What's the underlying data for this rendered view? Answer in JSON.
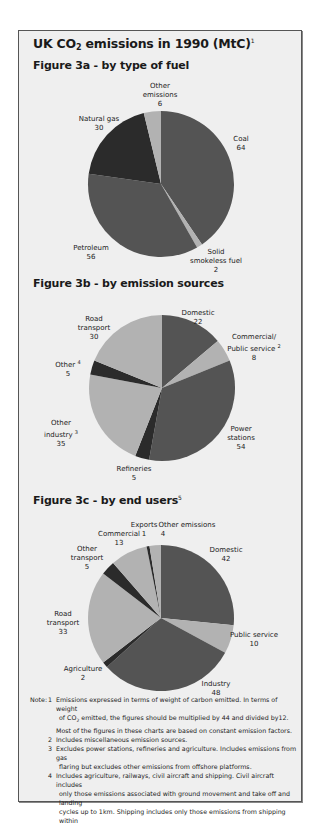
{
  "page": {
    "title_main": "UK CO",
    "title_sub": "2",
    "title_rest": " emissions in 1990 (MtC)",
    "title_sup": "1"
  },
  "colors": {
    "background": "#efefef",
    "dark": "#545454",
    "darkest": "#2b2b2b",
    "light": "#b2b2b2",
    "border": "#555555"
  },
  "chart_data": [
    {
      "type": "pie",
      "title": "Figure 3a - by type of fuel",
      "units": "MtC",
      "start_angle": "12 o'clock, clockwise",
      "categories": [
        "Coal",
        "Solid smokeless fuel",
        "Petroleum",
        "Natural gas",
        "Other emissions"
      ],
      "values": [
        64,
        2,
        56,
        30,
        6
      ],
      "shades": [
        "dark",
        "light",
        "dark",
        "darkest",
        "light"
      ]
    },
    {
      "type": "pie",
      "title": "Figure 3b - by emission sources",
      "units": "MtC",
      "start_angle": "12 o'clock, clockwise",
      "categories": [
        "Domestic",
        "Commercial/ Public service",
        "Power stations",
        "Refineries",
        "Other industry",
        "Other",
        "Road transport"
      ],
      "values": [
        22,
        8,
        54,
        5,
        35,
        5,
        30
      ],
      "shades": [
        "dark",
        "light",
        "dark",
        "darkest",
        "light",
        "darkest",
        "light"
      ],
      "footnote_refs": {
        "Commercial/ Public service": "2",
        "Other industry": "3",
        "Other": "4"
      }
    },
    {
      "type": "pie",
      "title": "Figure 3c - by end users",
      "title_sup": "5",
      "units": "MtC",
      "start_angle": "12 o'clock, clockwise",
      "categories": [
        "Domestic",
        "Public service",
        "Industry",
        "Agriculture",
        "Road transport",
        "Other transport",
        "Commercial",
        "Exports",
        "Other emissions"
      ],
      "values": [
        42,
        10,
        48,
        2,
        33,
        5,
        13,
        1,
        4
      ],
      "shades": [
        "dark",
        "light",
        "dark",
        "darkest",
        "light",
        "darkest",
        "light",
        "darkest",
        "light"
      ]
    }
  ],
  "figures": {
    "a": {
      "title": "Figure 3a - by type of fuel",
      "labels": {
        "other_l1": "Other",
        "other_l2": "emissions",
        "other_v": "6",
        "coal_l1": "Coal",
        "coal_v": "64",
        "gas_l1": "Natural gas",
        "gas_v": "30",
        "petrol_l1": "Petroleum",
        "petrol_v": "56",
        "ssf_l1": "Solid",
        "ssf_l2": "smokeless fuel",
        "ssf_v": "2"
      }
    },
    "b": {
      "title": "Figure 3b - by emission sources",
      "labels": {
        "dom_l1": "Domestic",
        "dom_v": "22",
        "com_l1": "Commercial/",
        "com_l2": "Public service",
        "com_sup": "2",
        "com_v": "8",
        "road_l1": "Road",
        "road_l2": "transport",
        "road_v": "30",
        "oth_l1": "Other",
        "oth_sup": "4",
        "oth_v": "5",
        "ind_l1": "Other",
        "ind_l2": "industry",
        "ind_sup": "3",
        "ind_v": "35",
        "pow_l1": "Power",
        "pow_l2": "stations",
        "pow_v": "54",
        "ref_l1": "Refineries",
        "ref_v": "5"
      }
    },
    "c": {
      "title": "Figure 3c - by end users",
      "title_sup": "5",
      "labels": {
        "exp_l1": "Exports",
        "exp_v": "1",
        "oem_l1": "Other emissions",
        "oem_v": "4",
        "com_l1": "Commercial",
        "com_v": "13",
        "otr_l1": "Other",
        "otr_l2": "transport",
        "otr_v": "5",
        "dom_l1": "Domestic",
        "dom_v": "42",
        "road_l1": "Road",
        "road_l2": "transport",
        "road_v": "33",
        "pub_l1": "Public service",
        "pub_v": "10",
        "agr_l1": "Agriculture",
        "agr_v": "2",
        "ind_l1": "Industry",
        "ind_v": "48"
      }
    }
  },
  "notes": {
    "prefix": "Note:",
    "n1_num": "1",
    "n1_l1": "Emissions expressed in terms of weight of carbon emitted. In terms of weight",
    "n1_l2a": "of CO",
    "n1_l2sub": "2",
    "n1_l2b": " emitted, the figures should be multiplied by 44 and divided by12.",
    "n1_l3": "Most of the figures in these charts are based on constant emission factors.",
    "n2_num": "2",
    "n2_l1": "Includes miscellaneous emission sources.",
    "n3_num": "3",
    "n3_l1": "Excludes power stations, refineries and agriculture. Includes emissions from gas",
    "n3_l2": "flaring but excludes other emissions from offshore platforms.",
    "n4_num": "4",
    "n4_l1": "Includes agriculture, railways, civil aircraft and shipping. Civil aircraft includes",
    "n4_l2": "only those emissions associated with ground movement and take off and landing",
    "n4_l3": "cycles up to 1km. Shipping includes only those emissions from shipping within"
  }
}
